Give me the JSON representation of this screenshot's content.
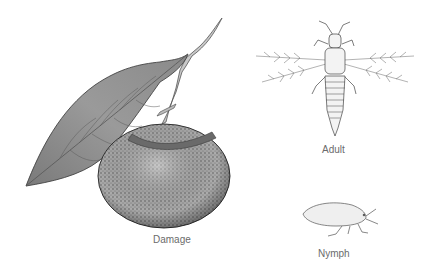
{
  "figure": {
    "panels": [
      {
        "id": "damage",
        "label": "Damage",
        "subject": "fruit with leaf and stem"
      },
      {
        "id": "adult",
        "label": "Adult",
        "subject": "winged insect, top view"
      },
      {
        "id": "nymph",
        "label": "Nymph",
        "subject": "wingless larva, side view"
      }
    ]
  }
}
